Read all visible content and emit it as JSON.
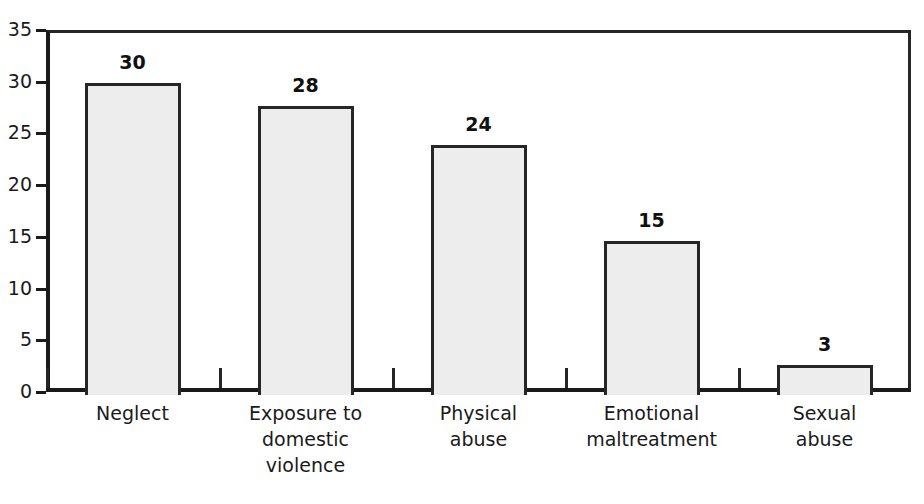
{
  "chart_data": {
    "type": "bar",
    "title": "",
    "subtitle": "",
    "xlabel": "",
    "ylabel": "",
    "categories": [
      "Neglect",
      "Exposure to\ndomestic\nviolence",
      "Physical\nabuse",
      "Emotional\nmaltreatment",
      "Sexual\nabuse"
    ],
    "values": [
      30,
      28,
      24,
      15,
      3
    ],
    "bar_heights": [
      29.9,
      27.7,
      23.9,
      14.6,
      2.6
    ],
    "data_labels": [
      "30",
      "28",
      "24",
      "15",
      "3"
    ],
    "ylim": [
      0,
      35
    ],
    "ytick_values": [
      0,
      5,
      10,
      15,
      20,
      25,
      30,
      35
    ],
    "ytick_labels": [
      "0",
      "5",
      "10",
      "15",
      "20",
      "25",
      "30",
      "35"
    ],
    "grid": false,
    "legend": null,
    "legend_position": "none",
    "bar_fill_color": "#ededed",
    "bar_border_color": "#262626",
    "axis_color": "#1a1a1a",
    "background_color": "#ffffff"
  }
}
